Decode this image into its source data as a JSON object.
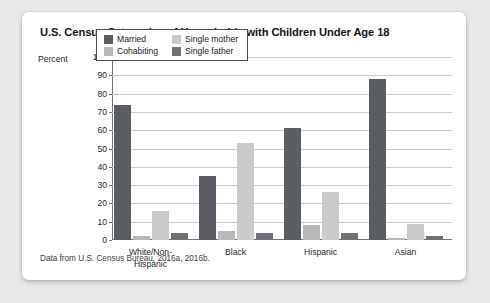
{
  "chart_data": {
    "type": "bar",
    "title": "U.S. Census Categories of Households with Children Under Age 18",
    "xlabel": "",
    "ylabel": "Percent",
    "ylim": [
      0,
      100
    ],
    "ytick_step": 10,
    "yticks": [
      0,
      10,
      20,
      30,
      40,
      50,
      60,
      70,
      80,
      90,
      100
    ],
    "grid": true,
    "legend_position": "top-center",
    "categories": [
      "White/Non-Hispanic",
      "Black",
      "Hispanic",
      "Asian"
    ],
    "category_lines": [
      [
        "White/Non-",
        "Hispanic"
      ],
      [
        "Black"
      ],
      [
        "Hispanic"
      ],
      [
        "Asian"
      ]
    ],
    "series": [
      {
        "name": "Married",
        "color": "#5a5d62",
        "values": [
          74,
          35,
          61,
          88
        ]
      },
      {
        "name": "Cohabiting",
        "color": "#b6b8ba",
        "values": [
          2,
          5,
          8,
          1
        ]
      },
      {
        "name": "Single mother",
        "color": "#c8cacb",
        "values": [
          16,
          53,
          26,
          9
        ]
      },
      {
        "name": "Single father",
        "color": "#6e7176",
        "values": [
          4,
          4,
          4,
          2
        ]
      }
    ],
    "legend_order": [
      "Married",
      "Single mother",
      "Cohabiting",
      "Single father"
    ],
    "source_note": "Data from U.S. Census Bureau, 2016a, 2016b."
  },
  "card": {
    "background": "#ffffff",
    "page_background": "#e8e8e8"
  }
}
